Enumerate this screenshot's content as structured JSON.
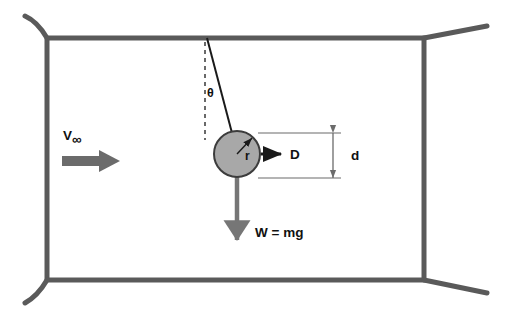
{
  "figure": {
    "background_color": "#ffffff"
  },
  "tunnel": {
    "name": "wind-tunnel-section",
    "border_color": "#5a5a5a",
    "border_width": 5,
    "rect": {
      "x": 47,
      "y": 38,
      "width": 377,
      "height": 242
    },
    "flares": [
      {
        "name": "top-left-flare",
        "type": "curve",
        "d": "M 47 38 C 40 26 34 20 25 16"
      },
      {
        "name": "top-right-flare",
        "type": "line",
        "d": "M 424 38 L 487 26"
      },
      {
        "name": "bottom-left-flare",
        "type": "curve",
        "d": "M 47 280 C 40 292 34 298 25 303"
      },
      {
        "name": "bottom-right-flare",
        "type": "line",
        "d": "M 424 280 L 487 293"
      }
    ]
  },
  "freestream": {
    "label": "V",
    "subscript": "∞",
    "label_x": 63,
    "label_y": 140,
    "arrow_color": "#6b6b6b",
    "arrow": {
      "x1": 62,
      "y1": 161,
      "x2": 120,
      "y2": 161
    }
  },
  "string": {
    "name": "suspension-string",
    "color": "#1a1a1a",
    "anchor": {
      "x": 207,
      "y": 38
    },
    "attach": {
      "x": 232,
      "y": 133
    }
  },
  "vertical_reference": {
    "name": "vertical-dashed-reference",
    "color": "#1a1a1a",
    "x": 205,
    "y1": 42,
    "y2": 140,
    "dash": "4,4"
  },
  "angle": {
    "label": "θ",
    "label_x": 207,
    "label_y": 97
  },
  "sphere": {
    "name": "sphere-body",
    "cx": 237,
    "cy": 154,
    "r": 23,
    "fill": "#a8a8a8",
    "stroke": "#3c3c3c",
    "stroke_width": 2
  },
  "radius": {
    "label": "r",
    "label_x": 245,
    "label_y": 160,
    "arrow_color": "#1a1a1a",
    "from": {
      "x": 237,
      "y": 154
    },
    "to": {
      "x": 252,
      "y": 138
    }
  },
  "drag": {
    "label": "D",
    "label_x": 290,
    "label_y": 159,
    "arrow_color": "#1a1a1a",
    "arrow": {
      "x1": 261,
      "y1": 154,
      "x2": 281,
      "y2": 154
    }
  },
  "weight": {
    "label": "W = mg",
    "label_x": 255,
    "label_y": 237,
    "arrow_color": "#767676",
    "arrow": {
      "x1": 237,
      "y1": 176,
      "x2": 237,
      "y2": 240
    }
  },
  "dimension": {
    "label": "d",
    "label_x": 351,
    "label_y": 160,
    "line_color": "#6b6b6b",
    "top_extension": {
      "x1": 258,
      "y1": 133,
      "x2": 341,
      "y2": 133
    },
    "bottom_extension": {
      "x1": 258,
      "y1": 178,
      "x2": 341,
      "y2": 178
    },
    "arrow_x": 333,
    "arrow_y1": 133,
    "arrow_y2": 178
  }
}
